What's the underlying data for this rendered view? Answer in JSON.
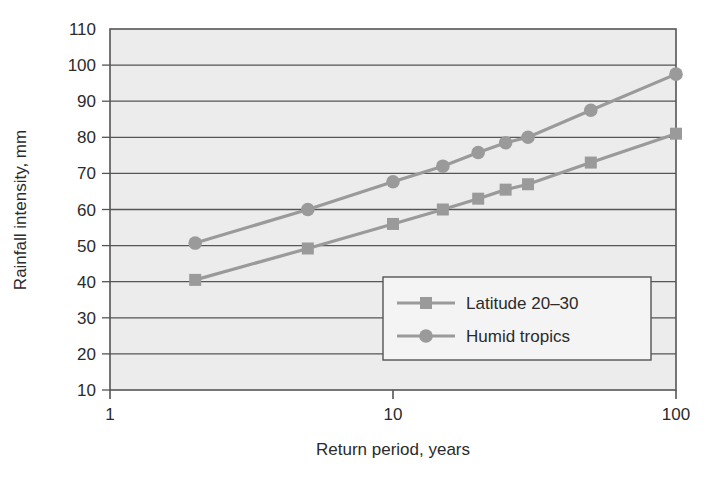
{
  "chart_data": {
    "type": "line",
    "title": "",
    "xlabel": "Return period, years",
    "ylabel": "Rainfall intensity, mm",
    "xscale": "log",
    "xlim": [
      1,
      100
    ],
    "ylim": [
      10,
      110
    ],
    "xticks": [
      "1",
      "10",
      "100"
    ],
    "xtick_values": [
      1,
      10,
      100
    ],
    "yticks": [
      "10",
      "20",
      "30",
      "40",
      "50",
      "60",
      "70",
      "80",
      "90",
      "100",
      "110"
    ],
    "ytick_values": [
      10,
      20,
      30,
      40,
      50,
      60,
      70,
      80,
      90,
      100,
      110
    ],
    "grid": "horizontal",
    "plot_background": "#ececec",
    "series_color": "#9a9a9a",
    "axis_color": "#555555",
    "legend": {
      "position": "inside-lower-right",
      "entries": [
        {
          "label": "Latitude 20–30",
          "marker": "square",
          "color": "#9a9a9a"
        },
        {
          "label": "Humid tropics",
          "marker": "circle",
          "color": "#9a9a9a"
        }
      ]
    },
    "series": [
      {
        "name": "Latitude 20–30",
        "marker": "square",
        "color": "#9a9a9a",
        "points": [
          {
            "x": 2,
            "y": 40.5
          },
          {
            "x": 5,
            "y": 49.2
          },
          {
            "x": 10,
            "y": 56.0
          },
          {
            "x": 15,
            "y": 60.0
          },
          {
            "x": 20,
            "y": 63.0
          },
          {
            "x": 25,
            "y": 65.5
          },
          {
            "x": 30,
            "y": 67.0
          },
          {
            "x": 50,
            "y": 73.0
          },
          {
            "x": 100,
            "y": 81.0
          }
        ]
      },
      {
        "name": "Humid tropics",
        "marker": "circle",
        "color": "#9a9a9a",
        "points": [
          {
            "x": 2,
            "y": 50.7
          },
          {
            "x": 5,
            "y": 60.0
          },
          {
            "x": 10,
            "y": 67.7
          },
          {
            "x": 15,
            "y": 72.0
          },
          {
            "x": 20,
            "y": 75.8
          },
          {
            "x": 25,
            "y": 78.5
          },
          {
            "x": 30,
            "y": 80.0
          },
          {
            "x": 50,
            "y": 87.5
          },
          {
            "x": 100,
            "y": 97.5
          }
        ]
      }
    ]
  }
}
